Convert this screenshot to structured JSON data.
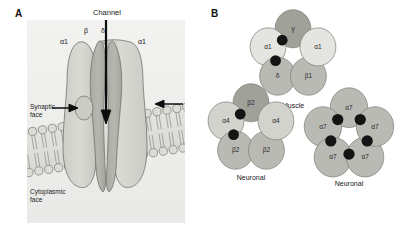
{
  "figure": {
    "panel_a": {
      "letter": "A",
      "labels": {
        "channel": "Channel",
        "beta": "β",
        "delta": "δ",
        "alpha1_left": "α1",
        "alpha1_right": "α1",
        "synaptic_face": "Synaptic\nface",
        "cytoplasmic_face": "Cytoplasmic\nface"
      },
      "icons": {
        "channel_arrow": "down-arrow-icon",
        "binding_site_arrow_left": "right-arrow-icon",
        "binding_site_arrow_right": "left-arrow-icon",
        "membrane": "lipid-bilayer-icon"
      },
      "colors": {
        "plate_background": "#eeeeed",
        "receptor_light": "#d4d5cf",
        "receptor_mid": "#bdbeb7",
        "receptor_dark": "#a9aaa3",
        "pore": "#9c9d96",
        "membrane_head": "#d8d8d2",
        "outline": "#6f7069",
        "arrow": "#111111"
      }
    },
    "panel_b": {
      "letter": "B",
      "colors": {
        "very_light": "#e4e5e0",
        "light": "#d2d3cd",
        "medium": "#b9bab3",
        "dark": "#a0a199",
        "outline": "#7c7d76",
        "binding_site": "#141414"
      },
      "pentamers": [
        {
          "id": "muscle",
          "caption": "Muscle",
          "subunits": [
            {
              "label": "γ",
              "shade": "dark",
              "angle_deg": 90
            },
            {
              "label": "α1",
              "shade": "very_light",
              "angle_deg": 162
            },
            {
              "label": "δ",
              "shade": "medium",
              "angle_deg": 234
            },
            {
              "label": "β1",
              "shade": "medium",
              "angle_deg": 306
            },
            {
              "label": "α1",
              "shade": "very_light",
              "angle_deg": 18
            }
          ],
          "binding_sites": 2
        },
        {
          "id": "neuronal-a4b2",
          "caption": "Neuronal",
          "subunits": [
            {
              "label": "β2",
              "shade": "dark",
              "angle_deg": 90
            },
            {
              "label": "α4",
              "shade": "light",
              "angle_deg": 162
            },
            {
              "label": "β2",
              "shade": "medium",
              "angle_deg": 234
            },
            {
              "label": "β2",
              "shade": "medium",
              "angle_deg": 306
            },
            {
              "label": "α4",
              "shade": "light",
              "angle_deg": 18
            }
          ],
          "binding_sites": 2
        },
        {
          "id": "neuronal-a7",
          "caption": "Neuronal",
          "subunits": [
            {
              "label": "α7",
              "shade": "medium",
              "angle_deg": 90
            },
            {
              "label": "α7",
              "shade": "medium",
              "angle_deg": 162
            },
            {
              "label": "α7",
              "shade": "medium",
              "angle_deg": 234
            },
            {
              "label": "α7",
              "shade": "medium",
              "angle_deg": 306
            },
            {
              "label": "α7",
              "shade": "medium",
              "angle_deg": 18
            }
          ],
          "binding_sites": 5
        }
      ]
    }
  }
}
